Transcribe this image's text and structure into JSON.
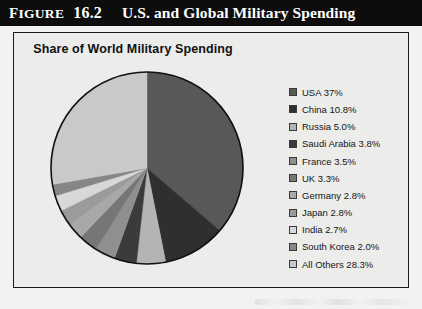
{
  "figure": {
    "label_word": "IGURE",
    "label_cap": "F",
    "number": "16.2",
    "title": "U.S. and Global Military Spending"
  },
  "chart_title": "Share of World Military Spending",
  "colors": {
    "title_bar_bg": "#0d0d0d",
    "panel_bg": "#ececeb",
    "panel_border": "#1a1a1a",
    "page_bg": "#f2f2f0"
  },
  "chart_data": {
    "type": "pie",
    "title": "Share of World Military Spending",
    "xlabel": "",
    "ylabel": "",
    "legend_position": "right",
    "start_angle_deg": 0,
    "direction": "clockwise",
    "categories": [
      "USA",
      "China",
      "Russia",
      "Saudi Arabia",
      "France",
      "UK",
      "Germany",
      "Japan",
      "India",
      "South Korea",
      "All Others"
    ],
    "values": [
      37,
      10.8,
      5.0,
      3.8,
      3.5,
      3.3,
      2.8,
      2.8,
      2.7,
      2.0,
      28.3
    ],
    "slice_colors": [
      "#585858",
      "#2f2f2f",
      "#b4b4b4",
      "#3b3b3b",
      "#8f8f8f",
      "#767676",
      "#a8a8a8",
      "#9b9b9b",
      "#d8d8d8",
      "#868686",
      "#c9c9c9"
    ],
    "labels": [
      "USA 37%",
      "China 10.8%",
      "Russia 5.0%",
      "Saudi Arabia 3.8%",
      "France 3.5%",
      "UK 3.3%",
      "Germany 2.8%",
      "Japan 2.8%",
      "India 2.7%",
      "South Korea 2.0%",
      "All Others 28.3%"
    ]
  },
  "legend": {
    "items": [
      {
        "label": "USA 37%",
        "color": "#585858"
      },
      {
        "label": "China 10.8%",
        "color": "#2f2f2f"
      },
      {
        "label": "Russia 5.0%",
        "color": "#b4b4b4"
      },
      {
        "label": "Saudi Arabia 3.8%",
        "color": "#3b3b3b"
      },
      {
        "label": "France 3.5%",
        "color": "#8f8f8f"
      },
      {
        "label": "UK 3.3%",
        "color": "#767676"
      },
      {
        "label": "Germany 2.8%",
        "color": "#a8a8a8"
      },
      {
        "label": "Japan 2.8%",
        "color": "#9b9b9b"
      },
      {
        "label": "India 2.7%",
        "color": "#d8d8d8"
      },
      {
        "label": "South Korea 2.0%",
        "color": "#868686"
      },
      {
        "label": "All Others 28.3%",
        "color": "#c9c9c9"
      }
    ]
  }
}
